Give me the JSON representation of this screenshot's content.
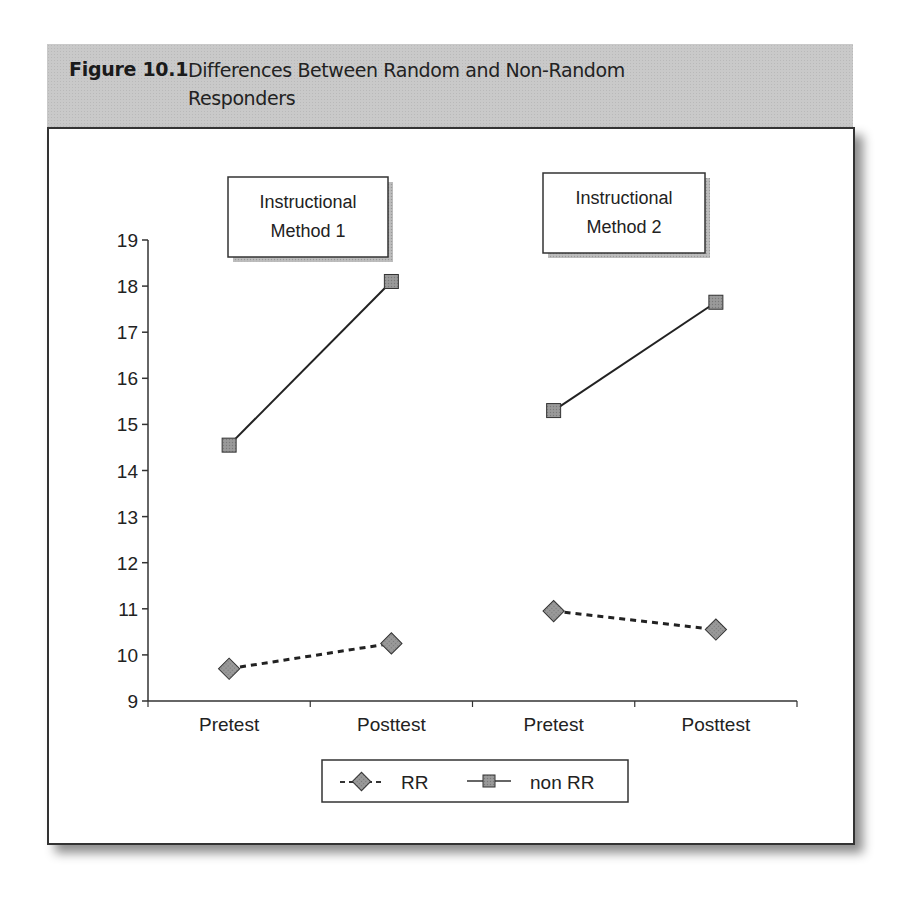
{
  "header": {
    "figure_label": "Figure 10.1",
    "title_line1": "Differences Between Random and Non-Random",
    "title_line2": "Responders",
    "background_color": "#c9c9c9"
  },
  "annotations": [
    {
      "line1": "Instructional",
      "line2": "Method 1"
    },
    {
      "line1": "Instructional",
      "line2": "Method 2"
    }
  ],
  "legend": {
    "items": [
      {
        "label": "RR",
        "marker": "diamond",
        "line": "dashed"
      },
      {
        "label": "non RR",
        "marker": "square",
        "line": "solid"
      }
    ]
  },
  "chart_data": {
    "type": "line",
    "title": "Differences Between Random and Non-Random Responders",
    "categories": [
      "Pretest",
      "Posttest",
      "Pretest",
      "Posttest"
    ],
    "groups": [
      "Instructional Method 1",
      "Instructional Method 2"
    ],
    "series": [
      {
        "name": "RR",
        "values": [
          9.7,
          10.25,
          10.95,
          10.55
        ],
        "style": "dashed",
        "marker": "diamond",
        "segments": [
          [
            0,
            1
          ],
          [
            2,
            3
          ]
        ]
      },
      {
        "name": "non RR",
        "values": [
          14.55,
          18.1,
          15.3,
          17.65
        ],
        "style": "solid",
        "marker": "square",
        "segments": [
          [
            0,
            1
          ],
          [
            2,
            3
          ]
        ]
      }
    ],
    "xlabel": "",
    "ylabel": "",
    "ylim": [
      9,
      19
    ],
    "yticks": [
      9,
      10,
      11,
      12,
      13,
      14,
      15,
      16,
      17,
      18,
      19
    ],
    "grid": false,
    "legend_position": "bottom"
  }
}
